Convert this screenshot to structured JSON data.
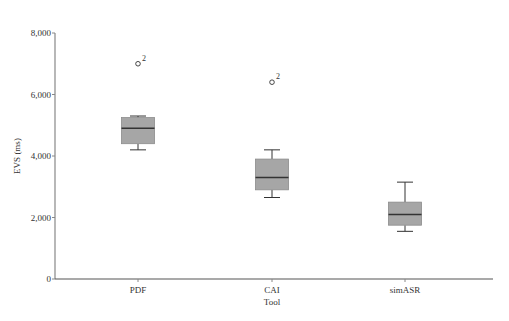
{
  "chart_data": {
    "type": "boxplot",
    "title": "",
    "xlabel": "Tool",
    "ylabel": "EVS (ms)",
    "ylim": [
      0,
      8000
    ],
    "yticks": [
      0,
      2000,
      4000,
      6000,
      8000
    ],
    "ytick_labels": [
      "0",
      "2,000",
      "4,000",
      "6,000",
      "8,000"
    ],
    "grid": false,
    "categories": [
      "PDF",
      "CAI",
      "simASR"
    ],
    "boxes": [
      {
        "category": "PDF",
        "whisker_low": 4200,
        "q1": 4400,
        "median": 4900,
        "q3": 5250,
        "whisker_high": 5300,
        "outliers": [
          {
            "value": 7000,
            "label": "2"
          }
        ]
      },
      {
        "category": "CAI",
        "whisker_low": 2650,
        "q1": 2900,
        "median": 3300,
        "q3": 3900,
        "whisker_high": 4200,
        "outliers": [
          {
            "value": 6400,
            "label": "2"
          }
        ]
      },
      {
        "category": "simASR",
        "whisker_low": 1550,
        "q1": 1750,
        "median": 2100,
        "q3": 2500,
        "whisker_high": 3150,
        "outliers": []
      }
    ],
    "colors": {
      "box_fill": "#a6a6a6",
      "box_stroke": "#8c8c8c",
      "median": "#333333",
      "axis": "#888888"
    }
  }
}
